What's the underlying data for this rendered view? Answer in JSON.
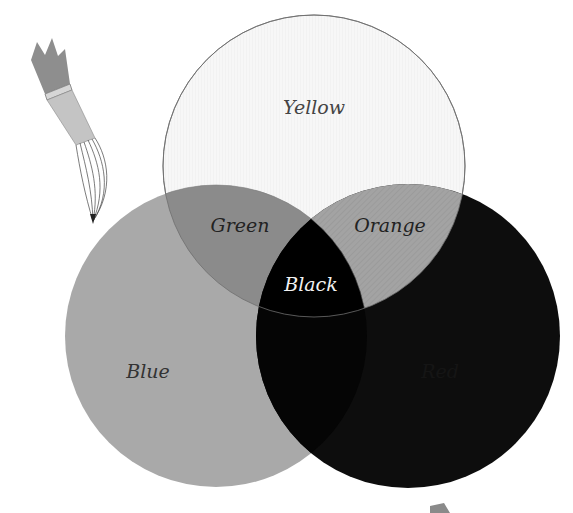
{
  "diagram": {
    "type": "venn",
    "circles": [
      {
        "id": "yellow",
        "label": "Yellow",
        "fill": "#f6f6f6",
        "cx": 314,
        "cy": 166,
        "r": 151
      },
      {
        "id": "blue",
        "label": "Blue",
        "fill": "#a9a9a9",
        "cx": 216,
        "cy": 336,
        "r": 151
      },
      {
        "id": "red",
        "label": "Red",
        "fill": "#0d0d0d",
        "cx": 408,
        "cy": 336,
        "r": 152
      }
    ],
    "overlaps": [
      {
        "id": "green",
        "label": "Green",
        "sets": [
          "yellow",
          "blue"
        ],
        "fill": "#8b8b8b"
      },
      {
        "id": "orange",
        "label": "Orange",
        "sets": [
          "yellow",
          "red"
        ],
        "fill": "#a3a3a3"
      },
      {
        "id": "black",
        "label": "Black",
        "sets": [
          "yellow",
          "blue",
          "red"
        ],
        "fill": "#000000"
      }
    ],
    "labels": {
      "yellow": "Yellow",
      "green": "Green",
      "orange": "Orange",
      "black": "Black",
      "blue": "Blue",
      "red": "Red"
    },
    "decoration": {
      "paintbrush_icon": "paintbrush-icon",
      "corner_arrow": "triangle-marker"
    }
  }
}
